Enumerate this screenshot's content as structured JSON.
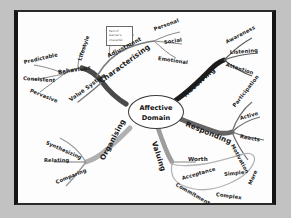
{
  "diagram": {
    "type": "mind-map",
    "title": "Affective Domain",
    "center": {
      "line1": "Affective",
      "line2": "Domain"
    },
    "note": {
      "text": "Part of learner's character"
    },
    "branches": [
      {
        "id": "characterising",
        "label": "Characterising",
        "color": "#4a4a4a",
        "children": [
          {
            "label": "Adjustment",
            "children": [
              {
                "label": "Personal"
              },
              {
                "label": "Social"
              },
              {
                "label": "Emotional"
              }
            ]
          },
          {
            "label": "Behaviour",
            "children": [
              {
                "label": "Lifestyle"
              },
              {
                "label": "Predictable"
              },
              {
                "label": "Consistent"
              },
              {
                "label": "Pervasive"
              }
            ]
          },
          {
            "label": "Value System"
          }
        ]
      },
      {
        "id": "receiving",
        "label": "Receiving",
        "color": "#1d1d1d",
        "children": [
          {
            "label": "Awareness"
          },
          {
            "label": "Listening"
          },
          {
            "label": "Attention"
          }
        ]
      },
      {
        "id": "responding",
        "label": "Responding",
        "color": "#656565",
        "children": [
          {
            "label": "Participation"
          },
          {
            "label": "Active"
          },
          {
            "label": "Reacts"
          },
          {
            "label": "Motivation"
          }
        ]
      },
      {
        "id": "valuing",
        "label": "Valuing",
        "color": "#9d9d9d",
        "children": [
          {
            "label": "Worth"
          },
          {
            "label": "Acceptance"
          },
          {
            "label": "Commitment"
          },
          {
            "label": "Simple"
          },
          {
            "label": "Complex"
          },
          {
            "label": "More"
          }
        ]
      },
      {
        "id": "organising",
        "label": "Organising",
        "color": "#b0b0b0",
        "children": [
          {
            "label": "Synthesizing"
          },
          {
            "label": "Relating"
          },
          {
            "label": "Comparing"
          }
        ]
      }
    ]
  }
}
